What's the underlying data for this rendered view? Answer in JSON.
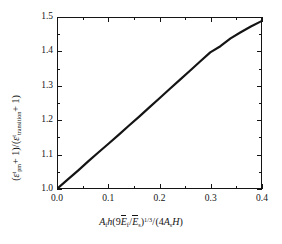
{
  "chart_data": {
    "type": "line",
    "title": "",
    "xlabel_plain": "A_f h (9 Ē_f / Ē_s)^(1/3) / (4 A_s H)",
    "ylabel_plain": "(ε^t_pm + 1) / (ε^t_transition + 1)",
    "xlim": [
      0.0,
      0.4
    ],
    "ylim": [
      1.0,
      1.5
    ],
    "xticks": [
      0.0,
      0.1,
      0.2,
      0.3,
      0.4
    ],
    "xticklabels": [
      "0.0",
      "0.1",
      "0.2",
      "0.3",
      "0.4"
    ],
    "yticks": [
      1.0,
      1.1,
      1.2,
      1.3,
      1.4,
      1.5
    ],
    "yticklabels": [
      "1.0",
      "1.1",
      "1.2",
      "1.3",
      "1.4",
      "1.5"
    ],
    "x_minor_ticks": [
      0.05,
      0.15,
      0.25,
      0.35
    ],
    "y_minor_ticks": [
      1.05,
      1.15,
      1.25,
      1.35,
      1.45
    ],
    "grid": false,
    "legend": false,
    "line_color": "#141414",
    "line_width": 2.2,
    "series": [
      {
        "name": "ratio-curve",
        "x": [
          0.0,
          0.02,
          0.04,
          0.06,
          0.08,
          0.1,
          0.12,
          0.14,
          0.16,
          0.18,
          0.2,
          0.22,
          0.24,
          0.26,
          0.28,
          0.3,
          0.32,
          0.34,
          0.36,
          0.38,
          0.4
        ],
        "y": [
          1.0,
          1.026,
          1.052,
          1.079,
          1.105,
          1.131,
          1.157,
          1.184,
          1.21,
          1.237,
          1.264,
          1.291,
          1.318,
          1.345,
          1.372,
          1.399,
          1.417,
          1.44,
          1.458,
          1.475,
          1.49
        ]
      }
    ]
  },
  "axis": {
    "x_title": {
      "A_f": "A",
      "sub_f": "f",
      "h": "h",
      "nine": "9",
      "E_f": "E",
      "sub_f2": "f",
      "E_s": "E",
      "sub_s": "s",
      "exponent": "1/3",
      "four": "4",
      "A_s": "A",
      "sub_s2": "s",
      "H": "H"
    },
    "y_title": {
      "eps1": "ε",
      "sup1": "t",
      "sub1": "pm",
      "plus1": "+ 1",
      "eps2": "ε",
      "sup2": "t",
      "sub2": "transition",
      "plus2": "+ 1"
    }
  },
  "colors": {
    "line": "#141414",
    "axis": "#141414",
    "background": "#ffffff"
  }
}
